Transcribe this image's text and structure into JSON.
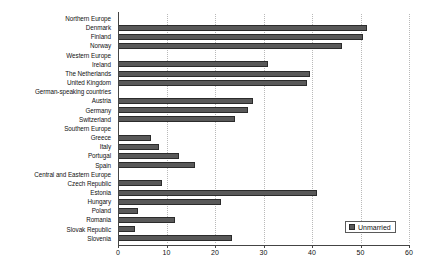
{
  "chart_data": {
    "type": "bar",
    "orientation": "horizontal",
    "title": "",
    "subtitle": "",
    "xlabel": "",
    "ylabel": "",
    "xlim": [
      0,
      60
    ],
    "ylim": null,
    "grid": true,
    "gridlines_axis": "x",
    "legend_position": "bottom-right",
    "legend": [
      {
        "name": "Unmarried",
        "color": "#595959"
      }
    ],
    "xticks": [
      0,
      10,
      20,
      30,
      40,
      50,
      60
    ],
    "xtick_labels": [
      "0",
      "10",
      "20",
      "30",
      "40",
      "50",
      "60"
    ],
    "categories": [
      "Northern Europe",
      "Denmark",
      "Finland",
      "Norway",
      "Western Europe",
      "Ireland",
      "The Netherlands",
      "United Kingdom",
      "German-speaking countries",
      "Austria",
      "Germany",
      "Switzerland",
      "Southern Europe",
      "Greece",
      "Italy",
      "Portugal",
      "Spain",
      "Central and Eastern Europe",
      "Czech Republic",
      "Estonia",
      "Hungary",
      "Poland",
      "Romania",
      "Slovak Republic",
      "Slovenia"
    ],
    "group_headers": [
      "Northern Europe",
      "Western Europe",
      "German-speaking countries",
      "Southern Europe",
      "Central and Eastern Europe"
    ],
    "series": [
      {
        "name": "Unmarried",
        "color": "#595959",
        "values": [
          null,
          51.3,
          50.5,
          46.2,
          null,
          30.9,
          39.6,
          39.0,
          null,
          27.8,
          26.8,
          24.1,
          null,
          6.8,
          8.5,
          12.6,
          15.9,
          null,
          9.1,
          41.0,
          21.2,
          4.1,
          11.8,
          3.5,
          23.5
        ]
      }
    ]
  }
}
